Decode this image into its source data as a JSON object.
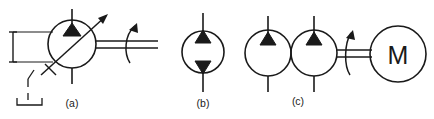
{
  "figure": {
    "kind": "schematic-diagram",
    "background_color": "#ffffff",
    "line_color": "#1a1a1a",
    "fill_color": "#1a1a1a",
    "width": 434,
    "height": 119
  },
  "symbols": [
    {
      "id": "a",
      "caption": "(a)",
      "caption_x": 72,
      "caption_y": 106,
      "name": "variable-displacement-pump",
      "circle": {
        "cx": 72,
        "cy": 44,
        "r": 24
      },
      "triangle": {
        "name": "flow-triangle-up",
        "direction": "up",
        "apex_x": 72,
        "apex_y": 23,
        "base_left_x": 63,
        "base_left_y": 35,
        "base_right_x": 81,
        "base_right_y": 35
      },
      "stems": [
        {
          "name": "port-stem-top",
          "x1": 72,
          "y1": 9,
          "x2": 72,
          "y2": 23
        },
        {
          "name": "port-stem-bottom",
          "x1": 72,
          "y1": 68,
          "x2": 72,
          "y2": 84
        }
      ],
      "diagonal_arrow": {
        "name": "variable-displacement-arrow",
        "x1": 40,
        "y1": 76,
        "x2": 108,
        "y2": 14,
        "tick_x1": 44,
        "tick_y1": 64,
        "tick_x2": 54,
        "tick_y2": 74
      },
      "left_bracket": {
        "name": "reservoir-bracket",
        "vertical_x": 13,
        "vertical_y1": 32,
        "vertical_y2": 62,
        "cap_top_y": 32,
        "cap_bottom_y": 62,
        "cap_half_width": 4,
        "line_top_y": 32,
        "line_bottom_y": 62,
        "line_x2": 52
      },
      "leader": {
        "name": "dashed-leader-line",
        "segments": [
          [
            31,
            71,
            28,
            78
          ],
          [
            28,
            78,
            28,
            86
          ],
          [
            28,
            92,
            28,
            99
          ]
        ],
        "bracket": {
          "left_x": 17,
          "right_x": 43,
          "y": 104,
          "tick_height": 7
        }
      },
      "shaft": {
        "name": "drive-shaft-double-line",
        "x1": 96,
        "x2": 158,
        "y_top": 41,
        "y_bottom": 48
      },
      "rotation_arrow": {
        "name": "shaft-rotation-arrow",
        "path": "M 131 62 C 125 54, 125 36, 136 25",
        "head": [
          [
            136,
            25
          ],
          [
            131,
            33
          ],
          [
            140,
            33
          ]
        ]
      }
    },
    {
      "id": "b",
      "caption": "(b)",
      "caption_x": 203,
      "caption_y": 106,
      "name": "fixed-displacement-bidirectional-pump",
      "circle": {
        "cx": 203,
        "cy": 52,
        "r": 21
      },
      "triangles": [
        {
          "name": "flow-triangle-up",
          "direction": "up",
          "apex_x": 203,
          "apex_y": 30,
          "base_left_x": 195,
          "base_left_y": 42,
          "base_right_x": 211,
          "base_right_y": 42
        },
        {
          "name": "flow-triangle-down",
          "direction": "down",
          "apex_x": 203,
          "apex_y": 74,
          "base_left_x": 195,
          "base_left_y": 62,
          "base_right_x": 211,
          "base_right_y": 62
        }
      ],
      "stems": [
        {
          "name": "port-stem-top",
          "x1": 203,
          "y1": 13,
          "x2": 203,
          "y2": 31
        },
        {
          "name": "port-stem-bottom",
          "x1": 203,
          "y1": 73,
          "x2": 203,
          "y2": 92
        }
      ]
    },
    {
      "id": "c",
      "caption": "(c)",
      "caption_x": 298,
      "caption_y": 104,
      "name": "tandem-pump-with-motor-drive",
      "circles": [
        {
          "name": "pump-circle-left",
          "cx": 268,
          "cy": 53,
          "r": 23
        },
        {
          "name": "pump-circle-right",
          "cx": 314,
          "cy": 53,
          "r": 23
        }
      ],
      "triangles": [
        {
          "name": "flow-triangle-up-left",
          "direction": "up",
          "apex_x": 268,
          "apex_y": 32,
          "base_left_x": 260,
          "base_left_y": 44,
          "base_right_x": 276,
          "base_right_y": 44
        },
        {
          "name": "flow-triangle-up-right",
          "direction": "up",
          "apex_x": 314,
          "apex_y": 32,
          "base_left_x": 306,
          "base_left_y": 44,
          "base_right_x": 322,
          "base_right_y": 44
        }
      ],
      "stems": [
        {
          "name": "port-stem-top-left",
          "x1": 268,
          "y1": 16,
          "x2": 268,
          "y2": 33
        },
        {
          "name": "port-stem-bottom-left",
          "x1": 268,
          "y1": 76,
          "x2": 268,
          "y2": 92
        },
        {
          "name": "port-stem-top-right",
          "x1": 314,
          "y1": 16,
          "x2": 314,
          "y2": 33
        },
        {
          "name": "port-stem-bottom-right",
          "x1": 314,
          "y1": 76,
          "x2": 314,
          "y2": 92
        }
      ],
      "shaft": {
        "name": "motor-coupling-shaft",
        "x1": 337,
        "x2": 372,
        "y_top": 50,
        "y_bottom": 57
      },
      "rotation_arrow": {
        "name": "motor-rotation-arrow",
        "path": "M 351 74 C 345 66, 345 45, 352 32",
        "head": [
          [
            352,
            32
          ],
          [
            347,
            40
          ],
          [
            356,
            40
          ]
        ]
      },
      "motor": {
        "name": "electric-motor",
        "letter": "M",
        "cx": 398,
        "cy": 54,
        "r": 28,
        "letter_x": 398,
        "letter_y": 63
      }
    }
  ]
}
